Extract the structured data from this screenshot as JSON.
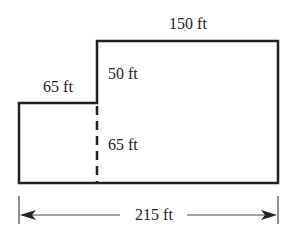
{
  "diagram": {
    "labels": {
      "left_top_width": "65 ft",
      "right_top_width": "150 ft",
      "right_upper_height": "50 ft",
      "dashed_height": "65 ft",
      "total_width": "215 ft"
    },
    "colors": {
      "stroke": "#222222",
      "background": "#ffffff"
    }
  }
}
